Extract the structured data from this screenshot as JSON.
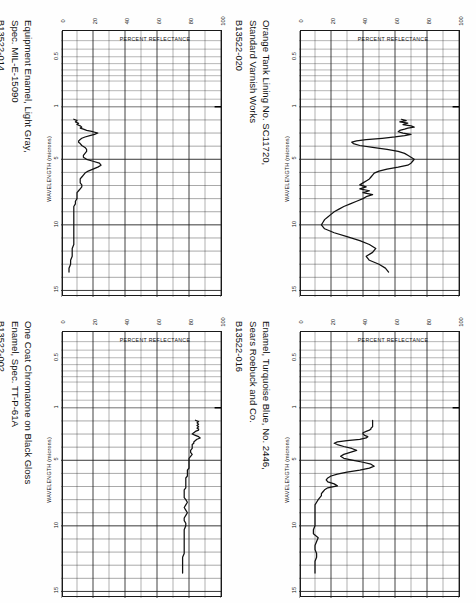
{
  "document": {
    "orientation": "rotated-90-ccw",
    "panel_count": 4
  },
  "axes": {
    "x_title": "WAVELENGTH (microns)",
    "y_title": "PERCENT REFLECTANCE",
    "x_ticks": [
      "0.5",
      "1",
      "5",
      "10",
      "15"
    ],
    "y_ticks": [
      "100",
      "80",
      "60",
      "40",
      "20",
      "0"
    ],
    "x_range": [
      0.35,
      15.5
    ],
    "y_range": [
      0,
      100
    ],
    "grid": "on",
    "grid_color": "#222222",
    "curve_color": "#111111"
  },
  "panels": [
    {
      "id": "B13522-014",
      "title": "Equipment Enamel, Light Gray,\nSpec. MIL-E-15090",
      "chart_data": {
        "type": "line",
        "title": "Equipment Enamel, Light Gray, Spec. MIL-E-15090",
        "xlabel": "WAVELENGTH (microns)",
        "ylabel": "PERCENT REFLECTANCE",
        "xlim": [
          0.35,
          15.5
        ],
        "ylim": [
          0,
          100
        ],
        "grid": true,
        "legend": "none",
        "x": [
          1.95,
          2.05,
          2.15,
          2.25,
          2.35,
          2.45,
          2.55,
          2.62,
          2.7,
          2.8,
          2.9,
          3.0,
          3.1,
          3.2,
          3.3,
          3.4,
          3.5,
          3.6,
          3.7,
          3.8,
          3.95,
          4.1,
          4.25,
          4.4,
          4.55,
          4.7,
          4.85,
          5.0,
          5.15,
          5.3,
          5.45,
          5.6,
          5.75,
          5.9,
          6.05,
          6.2,
          6.35,
          6.5,
          6.65,
          6.8,
          6.95,
          7.1,
          7.25,
          7.4,
          7.55,
          7.7,
          7.85,
          8.0,
          8.2,
          8.4,
          8.6,
          8.8,
          9.0,
          9.2,
          9.4,
          9.6,
          9.8,
          10.0,
          10.3,
          10.6,
          10.9,
          11.2,
          11.5,
          11.8,
          12.1,
          12.4,
          12.7,
          13.0,
          13.3,
          13.6
        ],
        "y": [
          8,
          10,
          9,
          11,
          10,
          12,
          13,
          12,
          14,
          16,
          20,
          23,
          21,
          18,
          15,
          13,
          12,
          11,
          11,
          12,
          13,
          15,
          16,
          16,
          15,
          14,
          14,
          16,
          20,
          24,
          25,
          23,
          20,
          17,
          15,
          14,
          13,
          12,
          12,
          12,
          13,
          13,
          12,
          11,
          10,
          10,
          10,
          10,
          9,
          9,
          8,
          8,
          8,
          8,
          8,
          8,
          8,
          8,
          8,
          8,
          8,
          8,
          8,
          7,
          7,
          7,
          6,
          6,
          5,
          5
        ]
      }
    },
    {
      "id": "B13522-020",
      "title": "Orange Tank Lining No. SC11720,\nStandard Varnish Works",
      "chart_data": {
        "type": "line",
        "title": "Orange Tank Lining No. SC11720, Standard Varnish Works",
        "xlabel": "WAVELENGTH (microns)",
        "ylabel": "PERCENT REFLECTANCE",
        "xlim": [
          0.35,
          15.5
        ],
        "ylim": [
          0,
          100
        ],
        "grid": true,
        "legend": "none",
        "x": [
          1.95,
          2.05,
          2.15,
          2.25,
          2.35,
          2.45,
          2.55,
          2.62,
          2.7,
          2.8,
          2.9,
          3.0,
          3.1,
          3.2,
          3.3,
          3.4,
          3.5,
          3.6,
          3.7,
          3.8,
          3.95,
          4.1,
          4.25,
          4.4,
          4.55,
          4.7,
          4.85,
          5.0,
          5.15,
          5.3,
          5.45,
          5.6,
          5.75,
          5.9,
          6.05,
          6.2,
          6.35,
          6.5,
          6.65,
          6.8,
          6.95,
          7.1,
          7.25,
          7.4,
          7.55,
          7.7,
          7.85,
          8.0,
          8.2,
          8.4,
          8.6,
          8.8,
          9.0,
          9.2,
          9.4,
          9.6,
          9.8,
          10.0,
          10.3,
          10.6,
          10.9,
          11.2,
          11.5,
          11.8,
          12.1,
          12.4,
          12.7,
          13.0,
          13.3,
          13.6
        ],
        "y": [
          64,
          67,
          63,
          68,
          65,
          70,
          72,
          68,
          66,
          63,
          62,
          65,
          70,
          66,
          60,
          52,
          42,
          36,
          33,
          34,
          38,
          46,
          55,
          62,
          66,
          68,
          70,
          72,
          71,
          70,
          68,
          62,
          55,
          50,
          47,
          46,
          45,
          44,
          42,
          40,
          38,
          42,
          38,
          44,
          40,
          46,
          42,
          40,
          36,
          32,
          28,
          25,
          22,
          20,
          18,
          16,
          15,
          14,
          16,
          22,
          30,
          38,
          44,
          48,
          46,
          42,
          44,
          50,
          54,
          56
        ]
      }
    },
    {
      "id": "B13522-002",
      "title": "One Coat Chromatone on Black Gloss\nEnamel, Spec. TT-P-61A",
      "chart_data": {
        "type": "line",
        "title": "One Coat Chromatone on Black Gloss Enamel, Spec. TT-P-61A",
        "xlabel": "WAVELENGTH (microns)",
        "ylabel": "PERCENT REFLECTANCE",
        "xlim": [
          0.35,
          15.5
        ],
        "ylim": [
          0,
          100
        ],
        "grid": true,
        "legend": "none",
        "x": [
          1.95,
          2.05,
          2.15,
          2.25,
          2.35,
          2.45,
          2.55,
          2.62,
          2.7,
          2.8,
          2.9,
          3.0,
          3.1,
          3.2,
          3.3,
          3.4,
          3.5,
          3.6,
          3.7,
          3.8,
          3.95,
          4.1,
          4.25,
          4.4,
          4.55,
          4.7,
          4.85,
          5.0,
          5.15,
          5.3,
          5.45,
          5.6,
          5.75,
          5.9,
          6.05,
          6.2,
          6.35,
          6.5,
          6.65,
          6.8,
          6.95,
          7.1,
          7.25,
          7.4,
          7.55,
          7.7,
          7.85,
          8.0,
          8.2,
          8.4,
          8.6,
          8.8,
          9.0,
          9.2,
          9.4,
          9.6,
          9.8,
          10.0,
          10.3,
          10.6,
          10.9,
          11.2,
          11.5,
          11.8,
          12.1,
          12.4,
          12.7,
          13.0,
          13.3,
          13.6
        ],
        "y": [
          84,
          86,
          85,
          86,
          85,
          86,
          85,
          86,
          86,
          84,
          83,
          82,
          84,
          86,
          87,
          85,
          84,
          83,
          83,
          82,
          82,
          82,
          81,
          81,
          82,
          81,
          80,
          80,
          80,
          80,
          80,
          80,
          79,
          79,
          79,
          79,
          78,
          78,
          78,
          78,
          78,
          78,
          77,
          77,
          77,
          77,
          77,
          78,
          79,
          78,
          77,
          78,
          79,
          78,
          77,
          77,
          78,
          78,
          77,
          77,
          77,
          77,
          77,
          77,
          77,
          76,
          76,
          76,
          76,
          76
        ]
      }
    },
    {
      "id": "B13522-016",
      "title": "Enamel, Turquoise Blue, No. 2446,\nSears Roebuck and Co.",
      "chart_data": {
        "type": "line",
        "title": "Enamel, Turquoise Blue, No. 2446, Sears Roebuck and Co.",
        "xlabel": "WAVELENGTH (microns)",
        "ylabel": "PERCENT REFLECTANCE",
        "xlim": [
          0.35,
          15.5
        ],
        "ylim": [
          0,
          100
        ],
        "grid": true,
        "legend": "none",
        "x": [
          1.95,
          2.05,
          2.15,
          2.25,
          2.35,
          2.45,
          2.55,
          2.62,
          2.7,
          2.8,
          2.9,
          3.0,
          3.1,
          3.2,
          3.3,
          3.4,
          3.5,
          3.6,
          3.7,
          3.8,
          3.95,
          4.1,
          4.25,
          4.4,
          4.55,
          4.7,
          4.85,
          5.0,
          5.15,
          5.3,
          5.45,
          5.6,
          5.75,
          5.9,
          6.05,
          6.2,
          6.35,
          6.5,
          6.65,
          6.8,
          6.95,
          7.1,
          7.25,
          7.4,
          7.55,
          7.7,
          7.85,
          8.0,
          8.2,
          8.4,
          8.6,
          8.8,
          9.0,
          9.2,
          9.4,
          9.6,
          9.8,
          10.0,
          10.3,
          10.6,
          10.9,
          11.2,
          11.5,
          11.8,
          12.1,
          12.4,
          12.7,
          13.0,
          13.3,
          13.6
        ],
        "y": [
          46,
          46,
          46,
          46,
          46,
          46,
          45,
          45,
          44,
          42,
          40,
          40,
          41,
          43,
          42,
          38,
          30,
          24,
          22,
          24,
          28,
          33,
          36,
          32,
          28,
          26,
          28,
          34,
          40,
          45,
          47,
          44,
          38,
          30,
          24,
          20,
          18,
          17,
          18,
          22,
          24,
          18,
          16,
          15,
          14,
          14,
          13,
          12,
          11,
          10,
          10,
          10,
          10,
          10,
          10,
          10,
          10,
          10,
          9,
          9,
          12,
          11,
          10,
          10,
          11,
          11,
          10,
          10,
          10,
          10
        ]
      }
    }
  ]
}
